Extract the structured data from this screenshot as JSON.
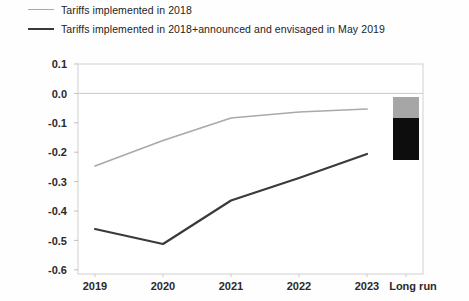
{
  "legend": {
    "position": "top-left",
    "entries": [
      {
        "label": "Tariffs implemented in 2018",
        "style": "light-thin",
        "color": "#a9a9a9"
      },
      {
        "label": "Tariffs implemented in 2018+announced and envisaged in May 2019",
        "style": "dark-thick",
        "color": "#3a3a3a"
      }
    ]
  },
  "chart_data": {
    "type": "line",
    "title": "",
    "subtitle": "",
    "xlabel": "",
    "ylabel": "",
    "categories": [
      "2019",
      "2020",
      "2021",
      "2022",
      "2023",
      "Long run"
    ],
    "ylim": [
      -0.6,
      0.1
    ],
    "yticks": [
      0.1,
      0.0,
      -0.1,
      -0.2,
      -0.3,
      -0.4,
      -0.5,
      -0.6
    ],
    "ytick_labels": [
      "0.1",
      "0.0",
      "-0.1",
      "-0.2",
      "-0.3",
      "-0.4",
      "-0.5",
      "-0.6"
    ],
    "grid": false,
    "zero_line": true,
    "legend_position": "top-left",
    "series": [
      {
        "name": "Tariffs implemented in 2018",
        "color": "#a9a9a9",
        "kind": "line",
        "x": [
          "2019",
          "2020",
          "2021",
          "2022",
          "2023"
        ],
        "values": [
          -0.24,
          -0.155,
          -0.08,
          -0.06,
          -0.05
        ]
      },
      {
        "name": "Tariffs implemented in 2018+announced and envisaged in May 2019",
        "color": "#3a3a3a",
        "kind": "line",
        "x": [
          "2019",
          "2020",
          "2021",
          "2022",
          "2023"
        ],
        "values": [
          -0.45,
          -0.5,
          -0.355,
          -0.28,
          -0.2
        ]
      },
      {
        "name": "Long run range",
        "kind": "stacked-bar",
        "x": [
          "Long run"
        ],
        "segments": [
          {
            "name": "Tariffs implemented in 2018",
            "color": "#a6a6a6",
            "from": -0.01,
            "to": -0.08
          },
          {
            "name": "Tariffs implemented in 2018+announced and envisaged in May 2019",
            "color": "#0d0d0d",
            "from": -0.08,
            "to": -0.22
          }
        ]
      }
    ]
  },
  "axis": {
    "y_tick_values": [
      "0.1",
      "0.0",
      "-0.1",
      "-0.2",
      "-0.3",
      "-0.4",
      "-0.5",
      "-0.6"
    ],
    "x_tick_values": [
      "2019",
      "2020",
      "2021",
      "2022",
      "2023",
      "Long run"
    ]
  },
  "colors": {
    "light_series": "#a9a9a9",
    "dark_series": "#3a3a3a",
    "bar_top": "#a6a6a6",
    "bar_bottom": "#0d0d0d",
    "axis": "#c9c9c9",
    "text": "#2a2a2a",
    "background": "#fefefe"
  }
}
